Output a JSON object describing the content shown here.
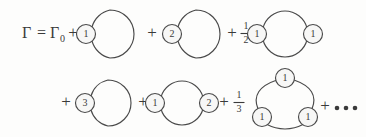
{
  "figure": {
    "name": "gamma-diagrammatic-expansion",
    "background_color": "#fdfdfc",
    "ink_color": "#4a4a4a",
    "lhs": {
      "gamma": "Γ",
      "equals": "=",
      "gamma_zero_symbol": "Γ",
      "gamma_zero_subscript": "0"
    },
    "operators": {
      "plus": "+",
      "ellipsis_dots": 3
    },
    "rows": [
      {
        "row_index": 0,
        "terms": [
          {
            "id": "term-1",
            "prefactor": null,
            "type": "single-loop-one-vertex",
            "vertices": [
              "1"
            ]
          },
          {
            "id": "term-2",
            "prefactor": null,
            "type": "single-loop-one-vertex",
            "vertices": [
              "2"
            ]
          },
          {
            "id": "term-3",
            "prefactor": {
              "numerator": "1",
              "denominator": "2"
            },
            "type": "double-loop-two-vertices",
            "vertices": [
              "1",
              "1"
            ]
          }
        ]
      },
      {
        "row_index": 1,
        "terms": [
          {
            "id": "term-4",
            "prefactor": null,
            "type": "single-loop-one-vertex",
            "vertices": [
              "3"
            ]
          },
          {
            "id": "term-5",
            "prefactor": null,
            "type": "double-loop-two-vertices",
            "vertices": [
              "1",
              "2"
            ]
          },
          {
            "id": "term-6",
            "prefactor": {
              "numerator": "1",
              "denominator": "3"
            },
            "type": "triangle-three-vertices",
            "vertices": [
              "1",
              "1",
              "1"
            ]
          }
        ]
      }
    ],
    "vertex_labels": {
      "v1": "1",
      "v2": "2",
      "v3": "3",
      "v4": "1",
      "v5": "1",
      "v6": "3",
      "v7": "1",
      "v8": "2",
      "v9": "1",
      "v10": "1",
      "v11": "1"
    },
    "fractions": {
      "half_num": "1",
      "half_den": "2",
      "third_num": "1",
      "third_den": "3"
    },
    "plus_signs": {
      "p1": "+",
      "p2": "+",
      "p3": "+",
      "p4": "+",
      "p5": "+",
      "p6": "+",
      "p7": "+"
    }
  }
}
